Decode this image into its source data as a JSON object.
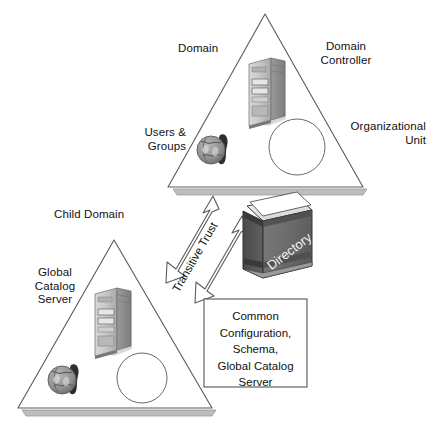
{
  "diagram": {
    "background_color": "#ffffff",
    "line_color": "#4a4a4a",
    "text_color": "#111111"
  },
  "parent_domain": {
    "label": "Domain",
    "domain_controller_label": "Domain\nController",
    "organizational_unit_label": "Organizational\nUnit",
    "users_groups_label": "Users &\nGroups",
    "icons": {
      "server": "server-tower-icon",
      "users": "globe-users-icon",
      "ou": "ou-circle-icon"
    }
  },
  "child_domain": {
    "label": "Child Domain",
    "global_catalog_label": "Global\nCatalog\nServer",
    "icons": {
      "server": "server-tower-icon",
      "users": "globe-users-icon",
      "ou": "ou-circle-icon"
    }
  },
  "trust": {
    "label": "Transitive Trust",
    "arrow": "double-headed-arrow"
  },
  "directory": {
    "label": "Directory",
    "icon": "directory-book-icon",
    "cover_color": "#6e6e6e",
    "spine_color": "#4f4f4f"
  },
  "common_box": {
    "lines": [
      "Common",
      "Configuration,",
      "Schema,",
      "Global Catalog",
      "Server"
    ],
    "border_color": "#555555"
  }
}
